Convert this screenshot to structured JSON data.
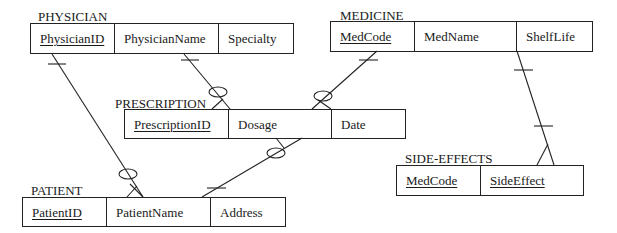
{
  "entities": {
    "physician": {
      "title": "PHYSICIAN",
      "attributes": [
        {
          "name": "PhysicianID",
          "key": true
        },
        {
          "name": "PhysicianName",
          "key": false
        },
        {
          "name": "Specialty",
          "key": false
        }
      ]
    },
    "medicine": {
      "title": "MEDICINE",
      "attributes": [
        {
          "name": "MedCode",
          "key": true
        },
        {
          "name": "MedName",
          "key": false
        },
        {
          "name": "ShelfLife",
          "key": false
        }
      ]
    },
    "prescription": {
      "title": "PRESCRIPTION",
      "attributes": [
        {
          "name": "PrescriptionID",
          "key": true
        },
        {
          "name": "Dosage",
          "key": false
        },
        {
          "name": "Date",
          "key": false
        }
      ]
    },
    "patient": {
      "title": "PATIENT",
      "attributes": [
        {
          "name": "PatientID",
          "key": true
        },
        {
          "name": "PatientName",
          "key": false
        },
        {
          "name": "Address",
          "key": false
        }
      ]
    },
    "side_effects": {
      "title": "SIDE-EFFECTS",
      "attributes": [
        {
          "name": "MedCode",
          "key": true
        },
        {
          "name": "SideEffect",
          "key": true
        }
      ]
    }
  },
  "relationships": [
    {
      "from": "PHYSICIAN",
      "from_cardinality": "one",
      "to": "PRESCRIPTION",
      "to_cardinality": "zero-or-many"
    },
    {
      "from": "MEDICINE",
      "from_cardinality": "one",
      "to": "PRESCRIPTION",
      "to_cardinality": "zero-or-many"
    },
    {
      "from": "PATIENT",
      "from_cardinality": "one",
      "to": "PRESCRIPTION",
      "to_cardinality": "zero-or-many"
    },
    {
      "from": "PHYSICIAN",
      "from_cardinality": "one",
      "to": "PATIENT",
      "to_cardinality": "zero-or-many"
    },
    {
      "from": "MEDICINE",
      "from_cardinality": "one",
      "to": "SIDE-EFFECTS",
      "to_cardinality": "one-or-many"
    }
  ]
}
